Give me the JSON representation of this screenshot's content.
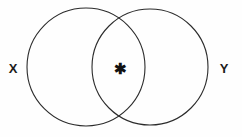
{
  "figure": {
    "type": "venn-diagram",
    "width": 242,
    "height": 137,
    "background_color": "#fefefe",
    "stroke_color": "#2b2b2b",
    "label_color": "#1c1c1c"
  },
  "sets": [
    {
      "id": "left",
      "label": "X",
      "label_x": 13,
      "label_y": 73,
      "cx": 86,
      "cy": 67,
      "r": 59
    },
    {
      "id": "right",
      "label": "Y",
      "label_x": 224,
      "label_y": 73,
      "cx": 150,
      "cy": 67,
      "r": 58
    }
  ],
  "markers": [
    {
      "id": "intersection-marker",
      "glyph": "✱",
      "icon_name": "asterisk-star-icon",
      "x": 120,
      "y": 74,
      "region": "intersection"
    }
  ]
}
